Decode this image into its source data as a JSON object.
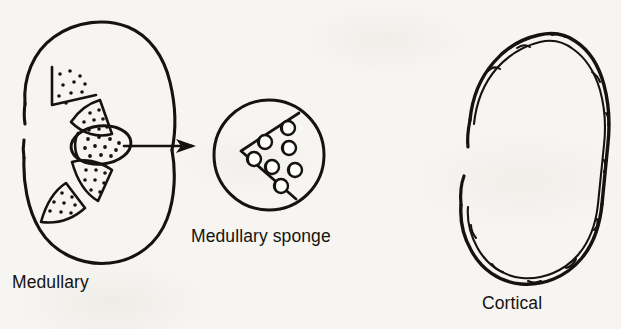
{
  "figure": {
    "kind": "medical-illustration",
    "background_color": "#f6f5f1",
    "ink_color": "#15130f",
    "panels": [
      {
        "id": "medullary",
        "caption": "Medullary",
        "shape": "kidney-outline-with-hilum-gap",
        "contents": "five stippled medullary pyramids; one enlarged cystic pyramid at the hilum"
      },
      {
        "id": "medullary-sponge",
        "caption": "Medullary sponge",
        "shape": "magnified-circle-inset",
        "contents": "wedge-shaped pyramid containing seven small rounded cysts",
        "cyst_count": 7
      },
      {
        "id": "cortical",
        "caption": "Cortical",
        "shape": "kidney-outline-double-wavy-contour",
        "contents": "irregular bumpy cortical surface indicating cortical cysts"
      }
    ],
    "connector": {
      "type": "arrow",
      "label": "",
      "from_panel": "medullary",
      "to_panel": "medullary-sponge",
      "direction": "left-to-right"
    }
  },
  "labels": {
    "medullary": "Medullary",
    "medullary_sponge": "Medullary sponge",
    "cortical": "Cortical"
  }
}
